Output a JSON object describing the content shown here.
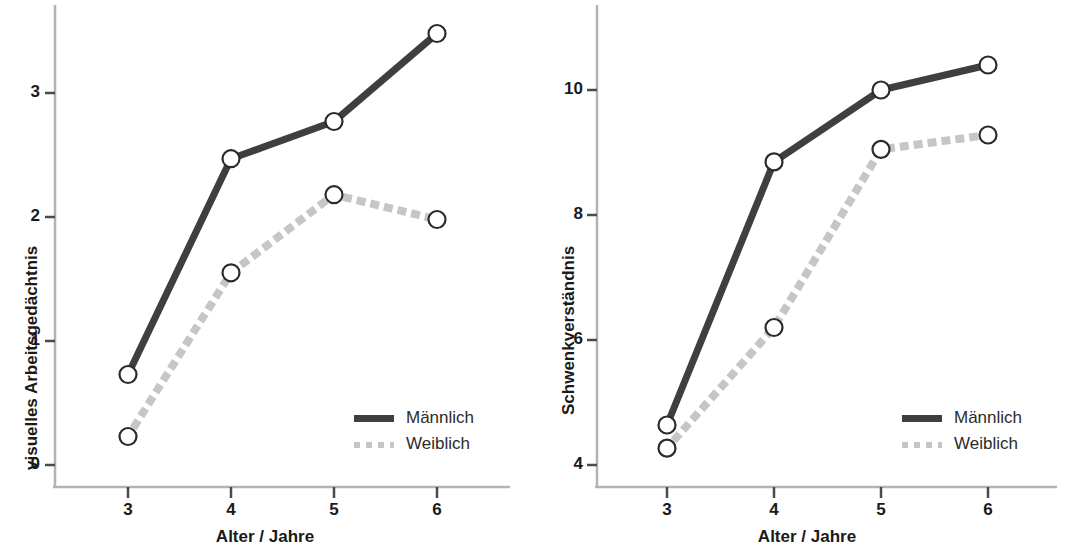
{
  "figure": {
    "panels": [
      {
        "id": "left",
        "y_axis_title": "visuelles Arbeitsgedächtnis",
        "x_axis_title": "Alter / Jahre",
        "y_tick_labels": [
          "3",
          "2",
          "1",
          "0"
        ],
        "x_tick_labels": [
          "3",
          "4",
          "5",
          "6"
        ],
        "legend": [
          {
            "label": "Männlich",
            "style": "solid"
          },
          {
            "label": "Weiblich",
            "style": "dotted"
          }
        ]
      },
      {
        "id": "right",
        "y_axis_title": "Schwenkverständnis",
        "x_axis_title": "Alter / Jahre",
        "y_tick_labels": [
          "10",
          "8",
          "6",
          "4"
        ],
        "x_tick_labels": [
          "3",
          "4",
          "5",
          "6"
        ],
        "legend": [
          {
            "label": "Männlich",
            "style": "solid"
          },
          {
            "label": "Weiblich",
            "style": "dotted"
          }
        ]
      }
    ]
  },
  "colors": {
    "male_line": "#3f3f3f",
    "female_line": "#c6c6c6",
    "axis": "#b3b3b3",
    "marker_fill": "#ffffff",
    "marker_stroke": "#2b2b2b",
    "text": "#1a1a1a"
  },
  "chart_data": [
    {
      "type": "line",
      "title": "",
      "panel": "left",
      "xlabel": "Alter / Jahre",
      "ylabel": "visuelles Arbeitsgedächtnis",
      "x": [
        3,
        4,
        5,
        6
      ],
      "xlim": [
        2.5,
        6.5
      ],
      "ylim": [
        -0.35,
        3.75
      ],
      "yticks": [
        0,
        1,
        2,
        3
      ],
      "xticks": [
        3,
        4,
        5,
        6
      ],
      "grid": false,
      "legend_position": "bottom-right",
      "markers": "open-circle",
      "series": [
        {
          "name": "Männlich",
          "style": "solid",
          "color": "#3f3f3f",
          "values": [
            0.73,
            2.47,
            2.77,
            3.48
          ]
        },
        {
          "name": "Weiblich",
          "style": "dotted",
          "color": "#c6c6c6",
          "values": [
            0.23,
            1.55,
            2.18,
            1.98
          ]
        }
      ]
    },
    {
      "type": "line",
      "title": "",
      "panel": "right",
      "xlabel": "Alter / Jahre",
      "ylabel": "Schwenkverständnis",
      "x": [
        3,
        4,
        5,
        6
      ],
      "xlim": [
        2.5,
        6.5
      ],
      "ylim": [
        3.65,
        10.9
      ],
      "yticks": [
        4,
        6,
        8,
        10
      ],
      "xticks": [
        3,
        4,
        5,
        6
      ],
      "grid": false,
      "legend_position": "bottom-right",
      "markers": "open-circle",
      "series": [
        {
          "name": "Männlich",
          "style": "solid",
          "color": "#3f3f3f",
          "values": [
            4.64,
            8.85,
            10.0,
            10.4
          ]
        },
        {
          "name": "Weiblich",
          "style": "dotted",
          "color": "#c6c6c6",
          "values": [
            4.27,
            6.2,
            9.05,
            9.28
          ]
        }
      ]
    }
  ]
}
